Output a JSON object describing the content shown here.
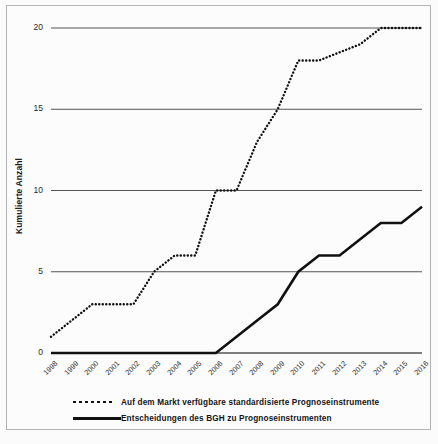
{
  "chart_data": {
    "type": "line",
    "title": "",
    "subtitle": "",
    "xlabel": "",
    "ylabel": "Kumulierte Anzahl",
    "categories": [
      "1998",
      "1999",
      "2000",
      "2001",
      "2002",
      "2003",
      "2004",
      "2005",
      "2006",
      "2007",
      "2008",
      "2009",
      "2010",
      "2011",
      "2012",
      "2013",
      "2014",
      "2015",
      "2016"
    ],
    "ylim": [
      0,
      20
    ],
    "yticks": [
      0,
      5,
      10,
      15,
      20
    ],
    "ytick_labels": [
      "0",
      "5",
      "10",
      "15",
      "20"
    ],
    "grid": "horizontal",
    "legend_position": "below-axes",
    "series": [
      {
        "name": "Auf dem Markt verfügbare standardisierte Prognoseinstrumente",
        "style": "dotted",
        "color": "#111111",
        "values": [
          1,
          2,
          3,
          3,
          3,
          5,
          6,
          6,
          10,
          10,
          13,
          15,
          18,
          18,
          18.5,
          19,
          20,
          20,
          20
        ]
      },
      {
        "name": "Entscheidungen des BGH zu Prognoseinstrumenten",
        "style": "solid",
        "color": "#111111",
        "values": [
          0,
          0,
          0,
          0,
          0,
          0,
          0,
          0,
          0,
          1,
          2,
          3,
          5,
          6,
          6,
          7,
          8,
          8,
          9
        ]
      }
    ]
  },
  "legend": {
    "items": [
      {
        "marker": "dotted-line-marker",
        "label": "Auf dem Markt verfügbare standardisierte Prognoseinstrumente"
      },
      {
        "marker": "solid-line-marker",
        "label": "Entscheidungen des BGH zu Prognoseinstrumenten"
      }
    ]
  }
}
